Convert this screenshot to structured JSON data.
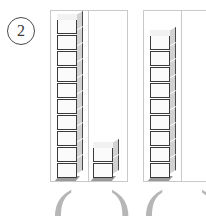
{
  "worksheet": {
    "problem_number": "2",
    "problem_number_marker": "circled-two",
    "instruction_visible": "",
    "groups": [
      {
        "id": "group-one",
        "cells": [
          {
            "id": "tens-cell",
            "block_type": "rod",
            "cube_count": 10,
            "place_value": "tens"
          },
          {
            "id": "ones-cell",
            "block_type": "units",
            "cube_count": 2,
            "place_value": "ones"
          }
        ],
        "total": 12,
        "answer_open_paren": "(",
        "answer_close_paren": ")",
        "answer_value": ""
      },
      {
        "id": "group-two",
        "cells": [
          {
            "id": "tens-cell",
            "block_type": "rod",
            "cube_count": 9,
            "place_value": "ones"
          },
          {
            "id": "ones-cell",
            "block_type": "units",
            "cube_count": 0,
            "place_value": "ones"
          }
        ],
        "total": 9,
        "answer_open_paren": "(",
        "answer_close_paren": ")",
        "answer_value": ""
      }
    ],
    "colors": {
      "cube_front": "#fbfbfb",
      "cube_side": "#d2d2d2",
      "cube_outline": "#3b3b3b",
      "frame_border": "#c9c9c9",
      "paren_color": "#b6b6b6",
      "number_color": "#3a3a3a"
    }
  }
}
